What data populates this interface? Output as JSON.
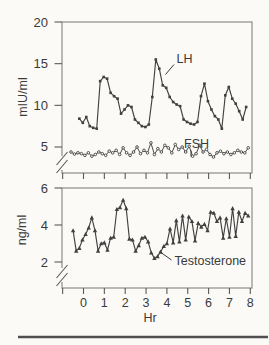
{
  "figure": {
    "background": "#fbfaf7",
    "ink": "#414141",
    "frame_color": "#8d8d8d",
    "bottom_rule_color": "#4f4f4f"
  },
  "chart_data": [
    {
      "type": "line",
      "title": "",
      "ylabel": "mIU/ml",
      "xlabel": "",
      "y_ticks": [
        20,
        15,
        10,
        5
      ],
      "ylim_shown": [
        5,
        20
      ],
      "axis_break": true,
      "x_ticks": [
        0,
        1,
        2,
        3,
        4,
        5,
        6,
        7,
        8
      ],
      "x_tick_labels_shown": false,
      "series": [
        {
          "name": "LH",
          "marker": "filled-square",
          "t_start_hr": -0.2,
          "t_step_hr": 0.1667,
          "values": [
            8.4,
            7.9,
            8.6,
            7.5,
            7.3,
            7.2,
            12.9,
            13.4,
            13.2,
            11.5,
            11.1,
            10.8,
            9.0,
            9.5,
            10.0,
            9.8,
            8.3,
            7.9,
            7.5,
            7.4,
            7.7,
            11.0,
            15.5,
            14.4,
            12.4,
            12.1,
            11.0,
            10.4,
            10.1,
            9.9,
            8.3,
            8.0,
            7.8,
            7.7,
            8.0,
            11.1,
            12.6,
            10.5,
            9.5,
            8.7,
            8.3,
            7.2,
            11.2,
            12.2,
            10.8,
            10.2,
            9.3,
            8.3,
            9.8
          ]
        },
        {
          "name": "FSH",
          "marker": "open-circle",
          "t_start_hr": -0.6,
          "t_step_hr": 0.1667,
          "values": [
            4.4,
            4.15,
            4.3,
            4.2,
            4.0,
            4.3,
            3.9,
            4.1,
            4.4,
            4.2,
            4.0,
            4.5,
            4.3,
            4.6,
            4.1,
            4.9,
            4.3,
            4.0,
            4.4,
            5.0,
            4.2,
            4.6,
            4.3,
            5.5,
            4.1,
            4.8,
            4.4,
            5.2,
            4.9,
            4.3,
            5.3,
            4.7,
            5.0,
            4.4,
            5.1,
            3.9,
            4.2,
            5.2,
            4.4,
            4.7,
            4.1,
            3.8,
            4.3,
            4.5,
            4.2,
            4.4,
            4.1,
            4.3,
            4.6,
            4.4,
            4.3,
            4.9
          ]
        }
      ]
    },
    {
      "type": "line",
      "title": "",
      "ylabel": "ng/ml",
      "xlabel": "Hr",
      "y_ticks": [
        6,
        4,
        2
      ],
      "ylim_shown": [
        2,
        6
      ],
      "axis_break": true,
      "x_ticks": [
        0,
        1,
        2,
        3,
        4,
        5,
        6,
        7,
        8
      ],
      "x_tick_labels_shown": true,
      "series": [
        {
          "name": "Testosterone",
          "marker": "filled-triangle",
          "t_start_hr": -0.5,
          "t_step_hr": 0.15,
          "values": [
            3.7,
            2.6,
            2.75,
            3.2,
            3.5,
            3.85,
            4.4,
            3.7,
            2.6,
            3.0,
            3.05,
            2.65,
            3.3,
            3.35,
            4.85,
            4.95,
            5.35,
            4.9,
            3.25,
            3.2,
            2.6,
            2.9,
            3.3,
            3.35,
            3.1,
            2.5,
            2.2,
            2.3,
            2.55,
            2.85,
            3.0,
            3.8,
            3.05,
            4.25,
            3.1,
            4.5,
            3.2,
            4.45,
            4.2,
            3.15,
            4.1,
            3.9,
            4.05,
            3.7,
            4.7,
            4.65,
            4.2,
            4.4,
            3.3,
            4.35,
            3.35,
            4.9,
            3.4,
            4.7,
            4.2,
            4.65,
            4.5
          ]
        }
      ]
    }
  ]
}
